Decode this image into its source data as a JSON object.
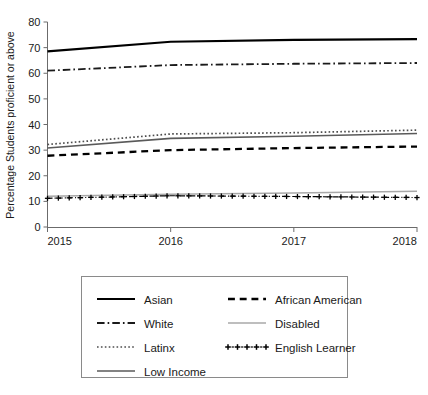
{
  "chart_data": {
    "type": "line",
    "title": "",
    "subtitle": "",
    "xlabel": "",
    "ylabel": "Percentage Students proficient or above",
    "x": [
      2015,
      2016,
      2017,
      2018
    ],
    "xtick_labels": [
      "2015",
      "2016",
      "2017",
      "2018"
    ],
    "xlim": [
      2015,
      2018
    ],
    "ylim": [
      0,
      80
    ],
    "ytick_labels": [
      "0",
      "10",
      "20",
      "30",
      "40",
      "50",
      "60",
      "70",
      "80"
    ],
    "ytick_values": [
      0,
      10,
      20,
      30,
      40,
      50,
      60,
      70,
      80
    ],
    "grid": false,
    "legend_position": "bottom",
    "legend_columns": 2,
    "series": [
      {
        "name": "Asian",
        "values": [
          68.5,
          72.3,
          73.0,
          73.3
        ],
        "color": "#000000",
        "style": "solid",
        "width": 2.2,
        "marker": "none",
        "legend_column": 0
      },
      {
        "name": "White",
        "values": [
          61.0,
          63.2,
          63.7,
          64.0
        ],
        "color": "#1a1a1a",
        "style": "dashdot",
        "width": 1.8,
        "marker": "none",
        "legend_column": 0
      },
      {
        "name": "Latinx",
        "values": [
          32.2,
          36.3,
          36.8,
          37.8
        ],
        "color": "#4d4d4d",
        "style": "dotted",
        "width": 1.7,
        "marker": "none",
        "legend_column": 0
      },
      {
        "name": "Low Income",
        "values": [
          30.8,
          34.6,
          35.4,
          36.5
        ],
        "color": "#5a5a5a",
        "style": "solid",
        "width": 1.6,
        "marker": "none",
        "legend_column": 0
      },
      {
        "name": "African American",
        "values": [
          27.8,
          30.0,
          30.8,
          31.4
        ],
        "color": "#000000",
        "style": "dashed",
        "width": 2.3,
        "marker": "none",
        "legend_column": 1
      },
      {
        "name": "Disabled",
        "values": [
          12.0,
          12.8,
          13.3,
          14.0
        ],
        "color": "#a8a8a8",
        "style": "solid",
        "width": 1.5,
        "marker": "none",
        "legend_column": 1
      },
      {
        "name": "English Learner",
        "values": [
          11.2,
          12.2,
          11.9,
          11.5
        ],
        "color": "#000000",
        "style": "dashdot",
        "width": 1.2,
        "marker": "plus",
        "legend_column": 1
      }
    ]
  },
  "legend": {
    "entries": [
      {
        "label": "Asian"
      },
      {
        "label": "African American"
      },
      {
        "label": "White"
      },
      {
        "label": "Disabled"
      },
      {
        "label": "Latinx"
      },
      {
        "label": "English Learner"
      },
      {
        "label": "Low Income"
      }
    ]
  }
}
